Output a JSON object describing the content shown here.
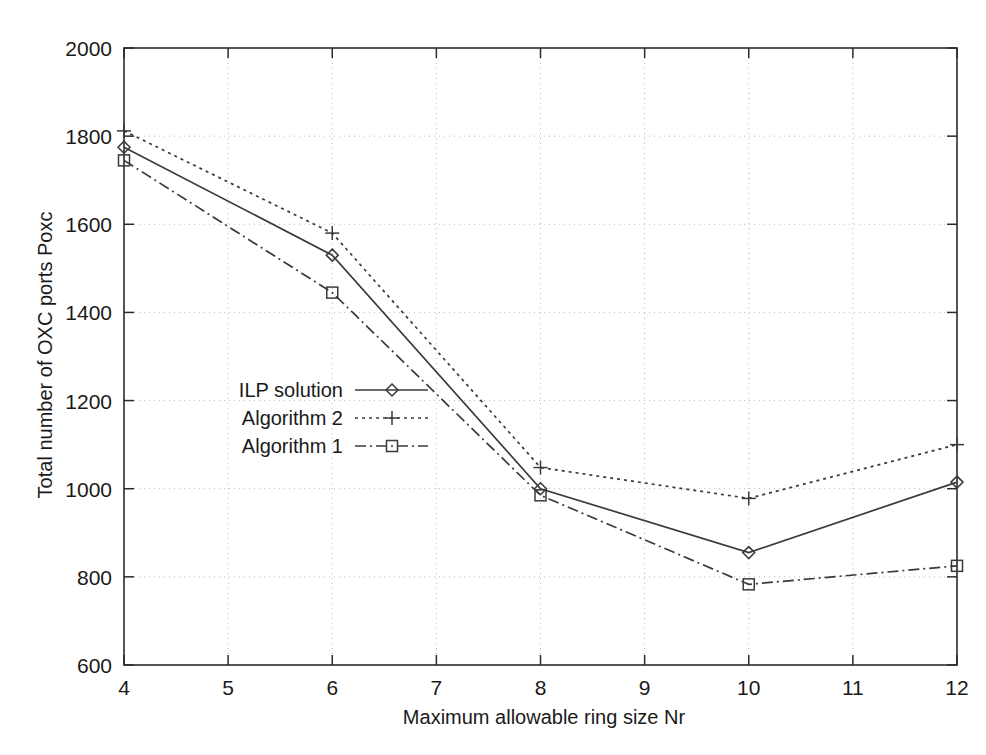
{
  "chart_data": {
    "type": "line",
    "title": "",
    "subtitle": "",
    "xlabel": "Maximum allowable ring size Nr",
    "ylabel": "Total number of OXC ports Poxc",
    "xlim": [
      4,
      12
    ],
    "ylim": [
      600,
      2000
    ],
    "xticks": [
      4,
      5,
      6,
      7,
      8,
      9,
      10,
      11,
      12
    ],
    "yticks": [
      600,
      800,
      1000,
      1200,
      1400,
      1600,
      1800,
      2000
    ],
    "xtick_labels": [
      "4",
      "5",
      "6",
      "7",
      "8",
      "9",
      "10",
      "11",
      "12"
    ],
    "ytick_labels": [
      "600",
      "800",
      "1000",
      "1200",
      "1400",
      "1600",
      "1800",
      "2000"
    ],
    "grid": true,
    "legend_position": "center-left-inside",
    "x": [
      4,
      6,
      8,
      10,
      12
    ],
    "series": [
      {
        "name": "ILP solution",
        "values": [
          1775,
          1530,
          1000,
          855,
          1015
        ],
        "linestyle": "solid",
        "marker": "diamond",
        "color": "#3a3a3a"
      },
      {
        "name": "Algorithm 2",
        "values": [
          1812,
          1580,
          1048,
          978,
          1100
        ],
        "linestyle": "dotted",
        "marker": "plus",
        "color": "#3a3a3a"
      },
      {
        "name": "Algorithm 1",
        "values": [
          1745,
          1445,
          985,
          783,
          825
        ],
        "linestyle": "dashdot",
        "marker": "square",
        "color": "#3a3a3a"
      }
    ]
  },
  "legend": {
    "entries": [
      {
        "label": "ILP solution",
        "linestyle": "solid",
        "marker": "diamond"
      },
      {
        "label": "Algorithm 2",
        "linestyle": "dotted",
        "marker": "plus"
      },
      {
        "label": "Algorithm 1",
        "linestyle": "dashdot",
        "marker": "square"
      }
    ]
  }
}
